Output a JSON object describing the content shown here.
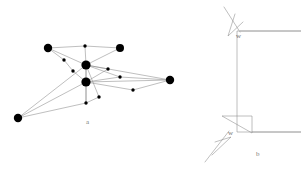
{
  "figure": {
    "background_color": "#ffffff",
    "width": 301,
    "height": 174,
    "stroke_color": "#8a8a8a",
    "node_color": "#000000",
    "label_color": "#7b7b7b"
  },
  "panel_a": {
    "caption": "a",
    "description": "graph-with-large-and-small-vertices",
    "large_nodes": [
      {
        "id": "n-top-left",
        "x": 48,
        "y": 48,
        "r": 4.2
      },
      {
        "id": "n-top-right",
        "x": 120,
        "y": 48,
        "r": 4.0
      },
      {
        "id": "n-center-up",
        "x": 86,
        "y": 65,
        "r": 4.6
      },
      {
        "id": "n-center-low",
        "x": 86,
        "y": 82,
        "r": 4.6
      },
      {
        "id": "n-far-right",
        "x": 170,
        "y": 80,
        "r": 4.2
      },
      {
        "id": "n-far-left",
        "x": 18,
        "y": 118,
        "r": 4.2
      }
    ],
    "small_nodes": [
      {
        "id": "s-top-mid",
        "x": 85,
        "y": 46,
        "r": 1.7
      },
      {
        "id": "s-upper-left",
        "x": 64,
        "y": 60,
        "r": 1.7
      },
      {
        "id": "s-mid-left",
        "x": 73,
        "y": 71,
        "r": 1.7
      },
      {
        "id": "s-right-up",
        "x": 108,
        "y": 69,
        "r": 1.7
      },
      {
        "id": "s-right-mid",
        "x": 120,
        "y": 77,
        "r": 1.7
      },
      {
        "id": "s-right-low",
        "x": 133,
        "y": 90,
        "r": 1.7
      },
      {
        "id": "s-below-mid",
        "x": 99,
        "y": 97,
        "r": 1.7
      },
      {
        "id": "s-bottom-mid",
        "x": 86,
        "y": 103,
        "r": 1.7
      }
    ],
    "edges": [
      [
        "n-top-left",
        "s-top-mid"
      ],
      [
        "s-top-mid",
        "n-top-right"
      ],
      [
        "n-top-left",
        "s-upper-left"
      ],
      [
        "s-upper-left",
        "s-mid-left"
      ],
      [
        "s-mid-left",
        "n-center-low"
      ],
      [
        "n-top-left",
        "n-center-up"
      ],
      [
        "n-center-up",
        "n-top-right"
      ],
      [
        "n-center-up",
        "s-top-mid"
      ],
      [
        "n-center-up",
        "n-center-low"
      ],
      [
        "n-center-up",
        "s-right-up"
      ],
      [
        "n-center-up",
        "s-right-mid"
      ],
      [
        "n-center-up",
        "n-far-right"
      ],
      [
        "n-center-up",
        "s-below-mid"
      ],
      [
        "n-center-up",
        "s-bottom-mid"
      ],
      [
        "n-center-low",
        "s-right-up"
      ],
      [
        "n-center-low",
        "s-right-mid"
      ],
      [
        "n-center-low",
        "n-far-right"
      ],
      [
        "n-center-low",
        "s-right-low"
      ],
      [
        "n-center-low",
        "s-bottom-mid"
      ],
      [
        "n-center-low",
        "n-far-left"
      ],
      [
        "s-right-mid",
        "n-far-right"
      ],
      [
        "s-right-low",
        "n-far-right"
      ],
      [
        "s-bottom-mid",
        "s-below-mid"
      ],
      [
        "s-bottom-mid",
        "n-far-left"
      ],
      [
        "n-far-left",
        "n-center-up"
      ]
    ]
  },
  "panel_b": {
    "caption": "b",
    "description": "rectangular-region-with-notched-corners",
    "width_label_top": "w",
    "width_label_bottom": "w",
    "outline_path": "M 232 31 L 42 31 L 42 132 L 228 132",
    "top_notch": {
      "wedge_path": "M 40 14 L 33 36 L 48 22",
      "diagonal_path": "M 29 7 L 45 32"
    },
    "bottom_notch": {
      "triangle_path": "M 27 116 L 57 116 L 57 133 Z",
      "wedge_path": "M 17 155 L 36 137 L 20 142",
      "diagonal_path": "M 10 162 L 34 131"
    }
  }
}
